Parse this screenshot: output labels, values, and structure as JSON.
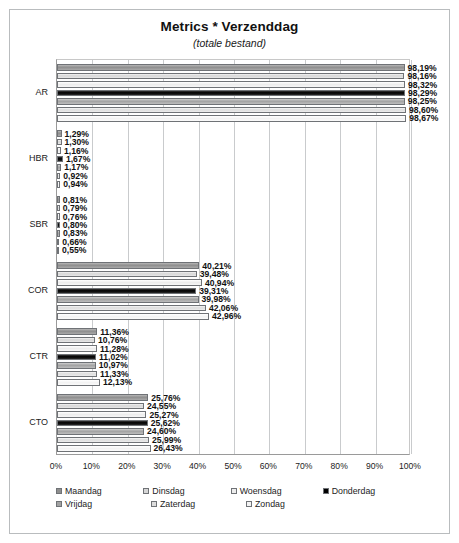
{
  "chart_data": {
    "type": "bar",
    "orientation": "horizontal",
    "title": "Metrics * Verzenddag",
    "subtitle": "(totale bestand)",
    "xlabel": "",
    "ylabel": "",
    "xlim": [
      0,
      100
    ],
    "grid": true,
    "legend_position": "bottom",
    "categories": [
      "AR",
      "HBR",
      "SBR",
      "COR",
      "CTR",
      "CTO"
    ],
    "x_ticks": [
      "0%",
      "10%",
      "20%",
      "30%",
      "40%",
      "50%",
      "60%",
      "70%",
      "80%",
      "90%",
      "100%"
    ],
    "x_tick_values": [
      0,
      10,
      20,
      30,
      40,
      50,
      60,
      70,
      80,
      90,
      100
    ],
    "series": [
      {
        "name": "Maandag",
        "color": "#8e8e8e",
        "values": [
          98.19,
          1.29,
          0.81,
          40.21,
          11.36,
          25.76
        ],
        "labels": [
          "98,19%",
          "1,29%",
          "0,81%",
          "40,21%",
          "11,36%",
          "25,76%"
        ]
      },
      {
        "name": "Dinsdag",
        "color": "#d6d6d6",
        "values": [
          98.16,
          1.3,
          0.79,
          39.48,
          10.76,
          24.55
        ],
        "labels": [
          "98,16%",
          "1,30%",
          "0,79%",
          "39,48%",
          "10,76%",
          "24,55%"
        ]
      },
      {
        "name": "Woensdag",
        "color": "#ededed",
        "values": [
          98.32,
          1.16,
          0.76,
          40.94,
          11.28,
          25.27
        ],
        "labels": [
          "98,32%",
          "1,16%",
          "0,76%",
          "40,94%",
          "11,28%",
          "25,27%"
        ]
      },
      {
        "name": "Donderdag",
        "color": "#000000",
        "values": [
          98.29,
          1.67,
          0.8,
          39.31,
          11.02,
          25.62
        ],
        "labels": [
          "98,29%",
          "1,67%",
          "0,80%",
          "39,31%",
          "11,02%",
          "25,62%"
        ]
      },
      {
        "name": "Vrijdag",
        "color": "#a2a2a2",
        "values": [
          98.25,
          1.17,
          0.83,
          39.98,
          10.97,
          24.6
        ],
        "labels": [
          "98,25%",
          "1,17%",
          "0,83%",
          "39,98%",
          "10,97%",
          "24,60%"
        ]
      },
      {
        "name": "Zaterdag",
        "color": "#dddddd",
        "values": [
          98.6,
          0.92,
          0.66,
          42.06,
          11.33,
          25.99
        ],
        "labels": [
          "98,60%",
          "0,92%",
          "0,66%",
          "42,06%",
          "11,33%",
          "25,99%"
        ]
      },
      {
        "name": "Zondag",
        "color": "#f3f3f3",
        "values": [
          98.67,
          0.94,
          0.55,
          42.96,
          12.13,
          26.43
        ],
        "labels": [
          "98,67%",
          "0,94%",
          "0,55%",
          "42,96%",
          "12,13%",
          "26,43%"
        ]
      }
    ]
  }
}
